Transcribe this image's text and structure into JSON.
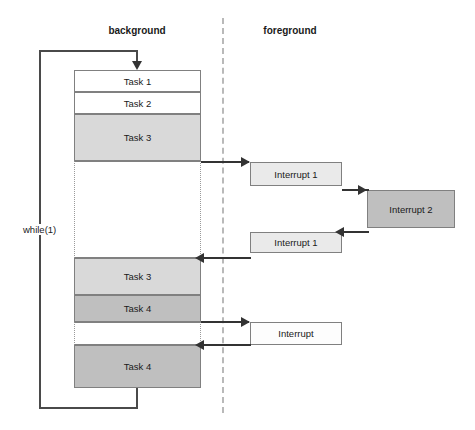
{
  "diagram": {
    "columns": {
      "background_label": "background",
      "foreground_label": "foreground"
    },
    "loop": {
      "label": "while(1)"
    },
    "colors": {
      "task_white": "#ffffff",
      "task_light_gray": "#d9d9d9",
      "task_dark_gray": "#bfbfbf",
      "interrupt_light": "#eaeaea",
      "interrupt_plain": "#fdfdfd",
      "border": "#808080",
      "arrow": "#333333",
      "divider": "#b9b9b9"
    },
    "background_blocks": [
      {
        "label": "Task 1",
        "fill": "white"
      },
      {
        "label": "Task 2",
        "fill": "white"
      },
      {
        "label": "Task 3",
        "fill": "light"
      },
      {
        "label": "",
        "fill": "idle"
      },
      {
        "label": "Task 3",
        "fill": "light"
      },
      {
        "label": "Task 4",
        "fill": "dark"
      },
      {
        "label": "",
        "fill": "idle"
      },
      {
        "label": "Task 4",
        "fill": "dark"
      }
    ],
    "foreground_blocks": [
      {
        "label": "Interrupt 1",
        "fill": "interrupt"
      },
      {
        "label": "Interrupt 2",
        "fill": "dark"
      },
      {
        "label": "Interrupt 1",
        "fill": "interrupt"
      },
      {
        "label": "Interrupt",
        "fill": "interrupt-plain"
      }
    ]
  }
}
